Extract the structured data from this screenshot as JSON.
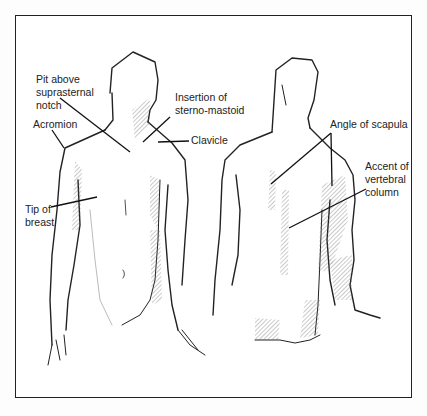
{
  "figure": {
    "labels": {
      "pit_above_suprasternal_notch": [
        "Pit above",
        "suprasternal",
        "notch"
      ],
      "acromion": [
        "Acromion"
      ],
      "insertion_sterno_mastoid": [
        "Insertion of",
        "sterno-mastoid"
      ],
      "clavicle": [
        "Clavicle"
      ],
      "tip_of_breast": [
        "Tip of",
        "breast"
      ],
      "angle_of_scapula": [
        "Angle of scapula"
      ],
      "accent_vertebral_column": [
        "Accent of",
        "vertebral",
        "column"
      ]
    },
    "views": [
      "front-view",
      "back-view"
    ]
  }
}
